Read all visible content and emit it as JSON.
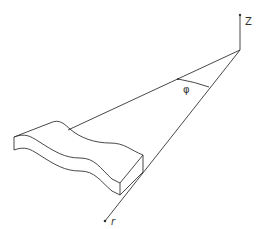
{
  "diagram": {
    "labels": {
      "z_axis": "Z",
      "angle": "φ",
      "radial": "r"
    },
    "colors": {
      "line": "#333333",
      "background": "#ffffff"
    }
  }
}
